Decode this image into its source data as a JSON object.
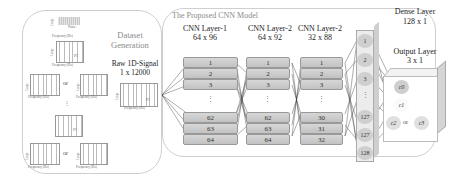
{
  "dataset_panel": {
    "title_line1": "Dataset",
    "title_line2": "Generation",
    "signals": [
      {
        "label": "Noise",
        "xlabel": "Frequency (Hz)",
        "ylabel": "Usage"
      },
      {
        "label": "PC",
        "xlabel": "Frequency (Hz)",
        "ylabel": "Usage"
      },
      {
        "label": "PC1B",
        "xlabel": "Frequency (Hz)",
        "ylabel": "Usage"
      },
      {
        "label": "PC2A",
        "xlabel": "Frequency (Hz)",
        "ylabel": "Usage"
      },
      {
        "label": "PC",
        "xlabel": "",
        "ylabel": ""
      },
      {
        "label": "PC2A",
        "xlabel": "Frequency (Hz)",
        "ylabel": "Usage"
      },
      {
        "label": "PC3B",
        "xlabel": "Frequency (Hz)",
        "ylabel": "Usage"
      }
    ],
    "or_label": "or",
    "ellipsis": "⋮",
    "raw_signal": {
      "title_line1": "Raw 1D-Signal",
      "title_line2": "1 x 12000",
      "label": "PC",
      "xlabel": "Frequency (Hz)",
      "ylabel": "Usage"
    }
  },
  "model_panel": {
    "title": "The Proposed CNN Model",
    "layers": [
      {
        "name": "CNN Layer-1",
        "shape": "64 x 96",
        "nodes": [
          "1",
          "2",
          "3",
          "62",
          "63",
          "64"
        ]
      },
      {
        "name": "CNN Layer-2",
        "shape": "64 x 92",
        "nodes": [
          "1",
          "2",
          "3",
          "62",
          "63",
          "64"
        ]
      },
      {
        "name": "CNN Layer-2",
        "shape": "32 x 88",
        "nodes": [
          "1",
          "2",
          "3",
          "30",
          "31",
          "32"
        ]
      }
    ],
    "dense": {
      "name": "Dense Layer",
      "shape": "128 x 1",
      "nodes": [
        "1",
        "2",
        "3",
        "127",
        "127",
        "128"
      ]
    },
    "output": {
      "name": "Output Layer",
      "shape": "3 x 1",
      "nodes": [
        "c0",
        "c1",
        "c2",
        "c3"
      ],
      "or_label": "or"
    },
    "ellipsis": "⋮"
  }
}
